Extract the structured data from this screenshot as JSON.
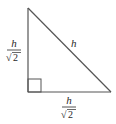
{
  "diagram": {
    "colors": {
      "stroke": "#555555",
      "text": "#2a2a2a",
      "background": "#ffffff"
    },
    "vertices": {
      "apex": {
        "x": 28,
        "y": 8
      },
      "right_angle": {
        "x": 28,
        "y": 92
      },
      "base_right": {
        "x": 111,
        "y": 92
      }
    },
    "right_angle_marker": {
      "x": 28,
      "y": 79,
      "size": 13
    },
    "labels": {
      "hypotenuse": "h",
      "left_leg": {
        "numerator": "h",
        "denominator": "2",
        "radical": "√"
      },
      "bottom_leg": {
        "numerator": "h",
        "denominator": "2",
        "radical": "√"
      }
    }
  }
}
